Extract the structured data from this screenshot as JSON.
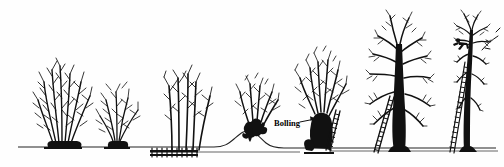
{
  "figure": {
    "background_color": "#fefefe",
    "ink_color": "#111111",
    "width": 504,
    "height": 167
  },
  "annotations": [
    {
      "id": "bolling",
      "label": "Bolling",
      "x": 274,
      "y": 123,
      "arrow_from_x": 300,
      "arrow_from_y": 121,
      "arrow_to_x": 317,
      "arrow_to_y": 118
    }
  ],
  "ground": {
    "base_y": 147,
    "mound_peak_y": 131,
    "description": "undulating ground line with a raised mound beneath the fourth tree"
  },
  "trees": [
    {
      "id": "tree-1",
      "name": "coppice-stool-multistem",
      "base_x": 62,
      "base_y": 147,
      "top_y": 62,
      "stems": 9,
      "has_ladder": false,
      "has_fence": true,
      "has_figure": false
    },
    {
      "id": "tree-2",
      "name": "young-coppice-shrub",
      "base_x": 117,
      "base_y": 147,
      "top_y": 86,
      "stems": 6,
      "has_ladder": false,
      "has_fence": true,
      "has_figure": false
    },
    {
      "id": "tree-3",
      "name": "coppice-with-hurdle-fence",
      "base_x": 186,
      "base_y": 152,
      "top_y": 66,
      "stems": 5,
      "has_ladder": false,
      "has_fence": true,
      "has_figure": false
    },
    {
      "id": "tree-4",
      "name": "low-stub-on-mound",
      "base_x": 249,
      "base_y": 134,
      "top_y": 76,
      "stems": 6,
      "has_ladder": false,
      "has_fence": false,
      "has_figure": false
    },
    {
      "id": "tree-5",
      "name": "pollard-with-bolling",
      "base_x": 322,
      "base_y": 147,
      "top_y": 22,
      "stems": 11,
      "has_ladder": true,
      "has_fence": false,
      "has_figure": false
    },
    {
      "id": "tree-6",
      "name": "shredded-tree-with-ladder",
      "base_x": 399,
      "base_y": 147,
      "top_y": 12,
      "stems": 14,
      "has_ladder": true,
      "has_fence": false,
      "has_figure": false
    },
    {
      "id": "tree-7",
      "name": "tall-pollard-with-climber",
      "base_x": 468,
      "base_y": 147,
      "top_y": 14,
      "stems": 9,
      "has_ladder": true,
      "has_fence": false,
      "has_figure": true
    }
  ],
  "ladders": [
    {
      "id": "ladder-1",
      "tree": "tree-5",
      "top_x": 337,
      "top_y": 110,
      "bottom_x": 327,
      "bottom_y": 150,
      "rungs": 9
    },
    {
      "id": "ladder-2",
      "tree": "tree-6",
      "top_x": 392,
      "top_y": 96,
      "bottom_x": 376,
      "bottom_y": 152,
      "rungs": 12
    },
    {
      "id": "ladder-3",
      "tree": "tree-7",
      "top_x": 467,
      "top_y": 62,
      "bottom_x": 452,
      "bottom_y": 152,
      "rungs": 16
    }
  ],
  "figures": [
    {
      "id": "climber",
      "label": "person climbing",
      "x": 458,
      "y": 42
    }
  ]
}
